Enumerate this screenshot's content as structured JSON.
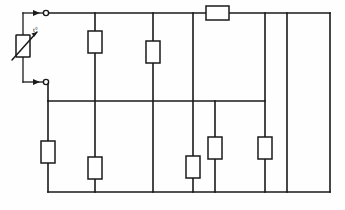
{
  "diagram": {
    "type": "circuit-schematic",
    "line_color": "#1a1a1a",
    "background_color": "#fefefe",
    "width": 345,
    "height": 210
  },
  "source_element": {
    "name": "thermistor",
    "symbol": "variable-resistor-with-diagonal-arrow",
    "label": "t°",
    "terminals": 2,
    "terminal_style": "open-circle-with-arrow-feed"
  },
  "rails": {
    "top_label": "top bus bar",
    "middle_label": "middle bus bar",
    "bottom_label": "bottom bus bar",
    "left_label": "left vertical rail",
    "right_label": "right vertical rail"
  },
  "components": {
    "horizontal_resistor_count": 1,
    "vertical_resistor_count": 7,
    "total_resistor_count": 8,
    "terminal_dot_count": 2,
    "arrow_count": 2
  },
  "geometry": {
    "top_rail_y": 13,
    "middle_rail_y": 101,
    "bottom_rail_y": 192,
    "left_rail_x": 48,
    "right_rail_x": 330,
    "branch_x": [
      95,
      153,
      193,
      215,
      265,
      287
    ]
  },
  "resistors": [
    {
      "id": "R1",
      "orientation": "vertical",
      "x": 95,
      "y": 42
    },
    {
      "id": "R2",
      "orientation": "vertical",
      "x": 153,
      "y": 52
    },
    {
      "id": "R3",
      "orientation": "horizontal",
      "x": 217,
      "y": 13
    },
    {
      "id": "R4",
      "orientation": "vertical",
      "x": 48,
      "y": 152
    },
    {
      "id": "R5",
      "orientation": "vertical",
      "x": 95,
      "y": 168
    },
    {
      "id": "R6",
      "orientation": "vertical",
      "x": 193,
      "y": 167
    },
    {
      "id": "R7",
      "orientation": "vertical",
      "x": 215,
      "y": 148
    },
    {
      "id": "R8",
      "orientation": "vertical",
      "x": 265,
      "y": 148
    }
  ]
}
